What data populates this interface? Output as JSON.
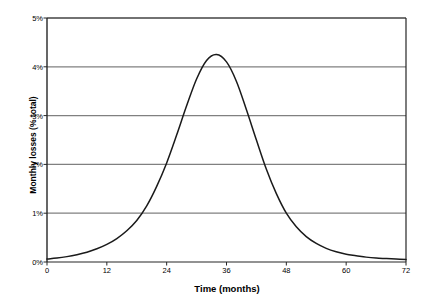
{
  "chart_data": {
    "type": "line",
    "title": "",
    "xlabel": "Time (months)",
    "ylabel": "Monthly losses (% total)",
    "xlim": [
      0,
      72
    ],
    "ylim": [
      0,
      5
    ],
    "xticks": [
      "0",
      "12",
      "24",
      "36",
      "48",
      "60",
      "72"
    ],
    "xtick_values": [
      0,
      12,
      24,
      36,
      48,
      60,
      72
    ],
    "yticks": [
      "0%",
      "1%",
      "2%",
      "3%",
      "4%",
      "5%"
    ],
    "ytick_values": [
      0,
      1,
      2,
      3,
      4,
      5
    ],
    "grid": "horizontal",
    "legend": "none",
    "series": [
      {
        "name": "Monthly losses",
        "color": "#1a1a1a",
        "x": [
          0,
          2,
          4,
          6,
          8,
          10,
          12,
          14,
          16,
          18,
          20,
          22,
          24,
          26,
          28,
          30,
          32,
          34,
          36,
          38,
          40,
          42,
          44,
          46,
          48,
          50,
          52,
          54,
          56,
          58,
          60,
          62,
          64,
          66,
          68,
          70,
          72
        ],
        "values": [
          0.06,
          0.08,
          0.11,
          0.15,
          0.2,
          0.27,
          0.36,
          0.48,
          0.64,
          0.85,
          1.15,
          1.55,
          2.03,
          2.6,
          3.2,
          3.75,
          4.13,
          4.25,
          4.1,
          3.7,
          3.12,
          2.5,
          1.9,
          1.4,
          1.0,
          0.72,
          0.52,
          0.38,
          0.28,
          0.21,
          0.16,
          0.13,
          0.1,
          0.08,
          0.07,
          0.06,
          0.05
        ]
      }
    ],
    "peak": {
      "x": 34,
      "y": 4.25
    }
  },
  "axis_colors": {
    "gridline": "#808080",
    "axis": "#262626",
    "curve": "#1a1a1a"
  }
}
